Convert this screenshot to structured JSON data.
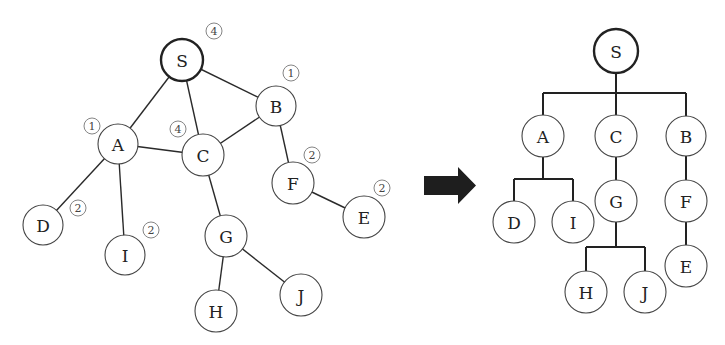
{
  "graph": {
    "nodes": [
      {
        "id": "S",
        "label": "S",
        "x": 182,
        "y": 60,
        "r": 21,
        "root": true,
        "badge": "4",
        "bx": 214,
        "by": 31
      },
      {
        "id": "A",
        "label": "A",
        "x": 118,
        "y": 144,
        "r": 20,
        "badge": "1",
        "bx": 92,
        "by": 126
      },
      {
        "id": "B",
        "label": "B",
        "x": 276,
        "y": 106,
        "r": 20,
        "badge": "1",
        "bx": 291,
        "by": 73
      },
      {
        "id": "C",
        "label": "C",
        "x": 203,
        "y": 155,
        "r": 21,
        "badge": "4",
        "bx": 178,
        "by": 129
      },
      {
        "id": "D",
        "label": "D",
        "x": 43,
        "y": 225,
        "r": 20,
        "badge": "2",
        "bx": 78,
        "by": 208
      },
      {
        "id": "I",
        "label": "I",
        "x": 125,
        "y": 255,
        "r": 20,
        "badge": "2",
        "bx": 151,
        "by": 230
      },
      {
        "id": "F",
        "label": "F",
        "x": 293,
        "y": 183,
        "r": 21,
        "badge": "2",
        "bx": 312,
        "by": 155
      },
      {
        "id": "E",
        "label": "E",
        "x": 364,
        "y": 217,
        "r": 21,
        "badge": "2",
        "bx": 382,
        "by": 188
      },
      {
        "id": "G",
        "label": "G",
        "x": 226,
        "y": 236,
        "r": 21
      },
      {
        "id": "H",
        "label": "H",
        "x": 216,
        "y": 311,
        "r": 21
      },
      {
        "id": "J",
        "label": "J",
        "x": 301,
        "y": 295,
        "r": 21
      }
    ],
    "edges": [
      [
        "S",
        "A"
      ],
      [
        "S",
        "C"
      ],
      [
        "S",
        "B"
      ],
      [
        "A",
        "C"
      ],
      [
        "C",
        "B"
      ],
      [
        "A",
        "D"
      ],
      [
        "A",
        "I"
      ],
      [
        "B",
        "F"
      ],
      [
        "F",
        "E"
      ],
      [
        "C",
        "G"
      ],
      [
        "G",
        "H"
      ],
      [
        "G",
        "J"
      ]
    ]
  },
  "arrow": {
    "label": "transforms-to"
  },
  "tree": {
    "nodes": [
      {
        "id": "S",
        "label": "S",
        "x": 616,
        "y": 51,
        "r": 22,
        "root": true
      },
      {
        "id": "A",
        "label": "A",
        "x": 543,
        "y": 136,
        "r": 21
      },
      {
        "id": "C",
        "label": "C",
        "x": 616,
        "y": 136,
        "r": 21
      },
      {
        "id": "B",
        "label": "B",
        "x": 686,
        "y": 136,
        "r": 20
      },
      {
        "id": "D",
        "label": "D",
        "x": 514,
        "y": 222,
        "r": 21
      },
      {
        "id": "I",
        "label": "I",
        "x": 573,
        "y": 222,
        "r": 21
      },
      {
        "id": "G",
        "label": "G",
        "x": 616,
        "y": 201,
        "r": 21
      },
      {
        "id": "F",
        "label": "F",
        "x": 686,
        "y": 201,
        "r": 21
      },
      {
        "id": "E",
        "label": "E",
        "x": 686,
        "y": 266,
        "r": 21
      },
      {
        "id": "H",
        "label": "H",
        "x": 586,
        "y": 292,
        "r": 21
      },
      {
        "id": "J",
        "label": "J",
        "x": 645,
        "y": 292,
        "r": 21
      }
    ],
    "connectors": [
      {
        "parent": "S",
        "children": [
          "A",
          "C",
          "B"
        ],
        "bar_y": 93
      },
      {
        "parent": "A",
        "children": [
          "D",
          "I"
        ],
        "bar_y": 179
      },
      {
        "parent": "C",
        "children": [
          "G"
        ]
      },
      {
        "parent": "B",
        "children": [
          "F"
        ]
      },
      {
        "parent": "G",
        "children": [
          "H",
          "J"
        ],
        "bar_y": 247
      },
      {
        "parent": "F",
        "children": [
          "E"
        ]
      }
    ]
  }
}
